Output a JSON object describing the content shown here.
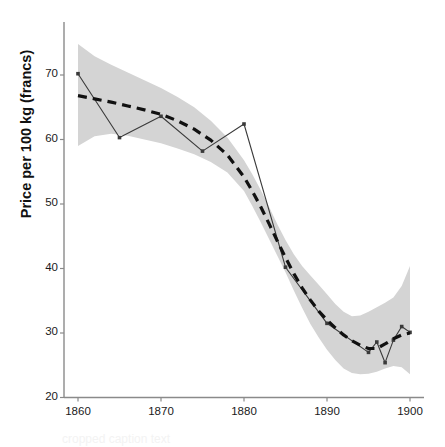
{
  "chart_data": {
    "type": "line",
    "title": "",
    "subtitle": "",
    "xlabel": "",
    "ylabel": "Price per 100 kg (francs)",
    "xlim": [
      1858,
      1901.5
    ],
    "ylim": [
      20,
      76
    ],
    "xticks": [
      1860,
      1870,
      1880,
      1890,
      1900
    ],
    "xtick_labels": [
      "1860",
      "1870",
      "1880",
      "1890",
      "1900"
    ],
    "yticks": [
      20,
      30,
      40,
      50,
      60,
      70
    ],
    "ytick_labels": [
      "20",
      "30",
      "40",
      "50",
      "60",
      "70"
    ],
    "grid": false,
    "legend": null,
    "legend_position": "none",
    "series": [
      {
        "name": "Observed price",
        "style": "solid-with-markers",
        "color": "#3a3a3a",
        "x": [
          1860,
          1865,
          1870,
          1875,
          1880,
          1885,
          1890,
          1895,
          1896,
          1897,
          1898,
          1899,
          1900
        ],
        "values": [
          70.2,
          60.3,
          63.6,
          58.2,
          62.4,
          40.2,
          31.5,
          27.0,
          28.6,
          25.4,
          28.9,
          31.0,
          30.1
        ]
      },
      {
        "name": "Fitted trend",
        "style": "dashed",
        "color": "#111111",
        "x": [
          1860,
          1862,
          1864,
          1866,
          1868,
          1870,
          1872,
          1874,
          1876,
          1878,
          1880,
          1881,
          1882,
          1883,
          1884,
          1885,
          1886,
          1887,
          1888,
          1889,
          1890,
          1891,
          1892,
          1893,
          1894,
          1895,
          1896,
          1897,
          1898,
          1899,
          1900
        ],
        "values": [
          66.8,
          66.3,
          65.8,
          65.2,
          64.6,
          63.9,
          62.9,
          61.6,
          59.9,
          57.6,
          54.2,
          52.0,
          49.6,
          47.0,
          44.3,
          41.7,
          39.2,
          37.0,
          35.1,
          33.4,
          32.0,
          30.8,
          29.7,
          28.8,
          28.1,
          27.6,
          27.6,
          28.3,
          29.1,
          29.7,
          30.0
        ]
      }
    ],
    "confidence_band": {
      "name": "Confidence band",
      "color": "#d4d4d4",
      "x": [
        1860,
        1862,
        1864,
        1866,
        1868,
        1870,
        1872,
        1874,
        1876,
        1878,
        1880,
        1881,
        1882,
        1883,
        1884,
        1885,
        1886,
        1887,
        1888,
        1889,
        1890,
        1891,
        1892,
        1893,
        1894,
        1895,
        1896,
        1897,
        1898,
        1899,
        1900
      ],
      "upper": [
        74.8,
        72.9,
        71.6,
        70.4,
        69.2,
        68.0,
        66.6,
        65.0,
        62.9,
        60.3,
        56.8,
        54.6,
        52.2,
        49.6,
        46.9,
        44.4,
        42.2,
        40.4,
        38.9,
        37.5,
        36.0,
        34.5,
        33.3,
        32.6,
        32.7,
        33.3,
        34.0,
        34.7,
        35.5,
        37.3,
        40.4
      ],
      "lower": [
        59.0,
        60.5,
        60.9,
        60.6,
        60.0,
        59.4,
        58.6,
        57.7,
        56.5,
        54.9,
        52.0,
        49.7,
        47.2,
        44.6,
        42.0,
        39.4,
        36.6,
        33.9,
        31.4,
        29.3,
        27.4,
        25.8,
        24.5,
        23.8,
        23.6,
        23.7,
        24.0,
        24.5,
        24.9,
        24.7,
        23.6
      ]
    },
    "axes": {
      "spine_color": "#8a8a8a",
      "left_spine": true,
      "bottom_spine": true,
      "top_spine": false,
      "right_spine": false
    }
  },
  "caption": {
    "text": "cropped caption text"
  }
}
